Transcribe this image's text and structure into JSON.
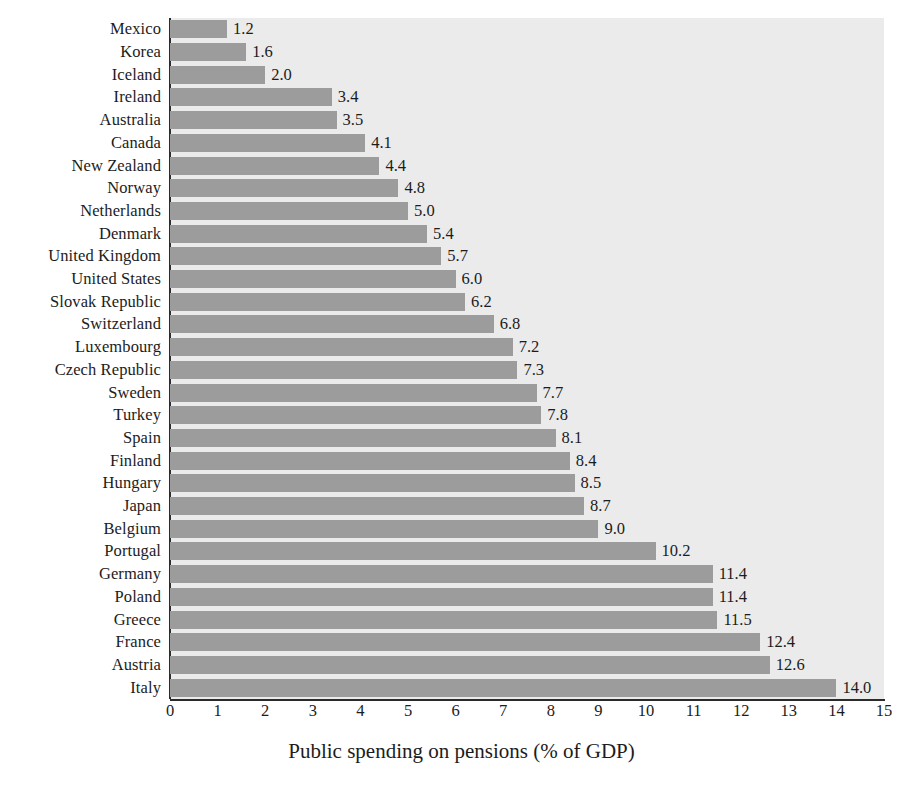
{
  "chart_data": {
    "type": "bar",
    "orientation": "horizontal",
    "title": "",
    "xlabel": "Public spending on pensions (% of GDP)",
    "ylabel": "",
    "xlim": [
      0,
      15
    ],
    "xticks": [
      "0",
      "1",
      "2",
      "3",
      "4",
      "5",
      "6",
      "7",
      "8",
      "9",
      "10",
      "11",
      "12",
      "13",
      "14",
      "15"
    ],
    "grid": false,
    "legend": null,
    "bar_color": "#9c9c9c",
    "plot_background": "#ebebeb",
    "page_background": "#ffffff",
    "axis_color": "#2b2b2b",
    "text_color": "#1c1c1c",
    "value_label_format": "one-decimal",
    "sort_order": "ascending",
    "categories": [
      "Mexico",
      "Korea",
      "Iceland",
      "Ireland",
      "Australia",
      "Canada",
      "New Zealand",
      "Norway",
      "Netherlands",
      "Denmark",
      "United Kingdom",
      "United States",
      "Slovak Republic",
      "Switzerland",
      "Luxembourg",
      "Czech Republic",
      "Sweden",
      "Turkey",
      "Spain",
      "Finland",
      "Hungary",
      "Japan",
      "Belgium",
      "Portugal",
      "Germany",
      "Poland",
      "Greece",
      "France",
      "Austria",
      "Italy"
    ],
    "values": [
      1.2,
      1.6,
      2.0,
      3.4,
      3.5,
      4.1,
      4.4,
      4.8,
      5.0,
      5.4,
      5.7,
      6.0,
      6.2,
      6.8,
      7.2,
      7.3,
      7.7,
      7.8,
      8.1,
      8.4,
      8.5,
      8.7,
      9.0,
      10.2,
      11.4,
      11.4,
      11.5,
      12.4,
      12.6,
      14.0
    ],
    "value_labels": [
      "1.2",
      "1.6",
      "2.0",
      "3.4",
      "3.5",
      "4.1",
      "4.4",
      "4.8",
      "5.0",
      "5.4",
      "5.7",
      "6.0",
      "6.2",
      "6.8",
      "7.2",
      "7.3",
      "7.7",
      "7.8",
      "8.1",
      "8.4",
      "8.5",
      "8.7",
      "9.0",
      "10.2",
      "11.4",
      "11.4",
      "11.5",
      "12.4",
      "12.6",
      "14.0"
    ]
  }
}
